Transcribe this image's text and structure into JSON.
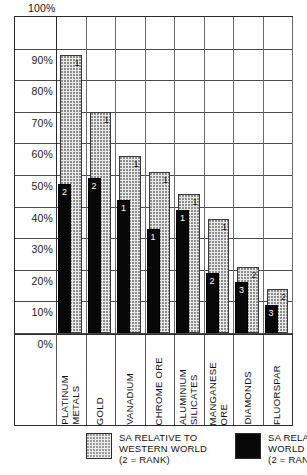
{
  "chart_data": {
    "type": "bar",
    "title": "",
    "xlabel": "",
    "ylabel": "",
    "ylim": [
      0,
      100
    ],
    "grid": true,
    "y_unit": "%",
    "y_ticks": [
      "100%",
      "90%",
      "80%",
      "70%",
      "60%",
      "50%",
      "40%",
      "30%",
      "20%",
      "10%",
      "0%"
    ],
    "categories": [
      "PLATINUM\nMETALS",
      "GOLD",
      "VANADIUM",
      "CHROME ORE",
      "ALUMINIUM\nSILICATES",
      "MANGANESE\nORE",
      "DIAMONDS",
      "FLUORSPAR"
    ],
    "series": [
      {
        "name": "SA RELATIVE TO WESTERN WORLD",
        "style": "grey-dotted",
        "color": "#e9e9e9",
        "values": [
          88,
          70,
          56,
          51,
          44,
          36,
          21,
          14
        ],
        "rank_labels": [
          "1",
          "1",
          "1",
          "1",
          "1",
          "1",
          "2",
          "2"
        ]
      },
      {
        "name": "SA RELATIVE TO WORLD",
        "style": "solid-black",
        "color": "#080808",
        "values": [
          47,
          49,
          42,
          33,
          39,
          19,
          16,
          9
        ],
        "rank_labels": [
          "2",
          "2",
          "1",
          "1",
          "1",
          "2",
          "3",
          "3"
        ]
      }
    ],
    "legend_position": "bottom",
    "legend": [
      {
        "swatch": "grey-dotted",
        "line1": "SA RELATIVE TO",
        "line2": "WESTERN WORLD",
        "line3": "(2 = RANK)"
      },
      {
        "swatch": "solid-black",
        "line1": "SA RELATIVE TO",
        "line2": "WORLD",
        "line3": "(2 = RANK)"
      }
    ]
  }
}
